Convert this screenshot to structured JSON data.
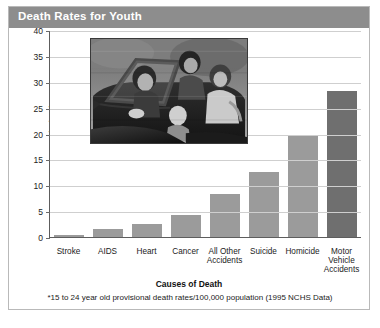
{
  "header": {
    "title": "Death Rates for Youth"
  },
  "footnote": {
    "text": "*15 to 24 year old provisional death rates/100,000 population (1995 NCHS Data)"
  },
  "photo": {
    "caption": "teens-in-convertible-photo"
  },
  "colors": {
    "header_bar": "#8d8d8d",
    "bar_fill": "#9b9b9b",
    "bar_fill_highlight": "#6f6f6f",
    "gridline": "#cfcfcf",
    "axis": "#5d5d5d",
    "page_background": "#ffffff"
  },
  "chart_data": {
    "type": "bar",
    "title": "Death Rates for Youth",
    "xlabel": "Causes of Death",
    "ylabel": "Youth deaths per 100,000*",
    "categories": [
      "Stroke",
      "AIDS",
      "Heart",
      "Cancer",
      "All Other Accidents",
      "Suicide",
      "Homicide",
      "Motor Vehicle Accidents"
    ],
    "category_lines": [
      [
        "Stroke"
      ],
      [
        "AIDS"
      ],
      [
        "Heart"
      ],
      [
        "Cancer"
      ],
      [
        "All Other",
        "Accidents"
      ],
      [
        "Suicide"
      ],
      [
        "Homicide"
      ],
      [
        "Motor",
        "Vehicle",
        "Accidents"
      ]
    ],
    "values": [
      0.4,
      1.6,
      2.6,
      4.2,
      8.3,
      12.5,
      19.5,
      28.3
    ],
    "highlight_index": 7,
    "ylim": [
      0,
      40
    ],
    "yticks": [
      0,
      5,
      10,
      15,
      20,
      25,
      30,
      35,
      40
    ],
    "ytick_labels": [
      "0",
      "5",
      "10",
      "15",
      "20",
      "25",
      "30",
      "35",
      "40"
    ],
    "grid": true,
    "legend": "none"
  }
}
